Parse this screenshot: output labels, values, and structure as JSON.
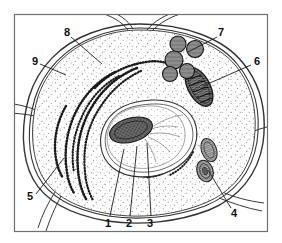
{
  "figure": {
    "kind": "biology-diagram",
    "frame": {
      "border_color": "#6f6f6f"
    },
    "colors": {
      "ink": "#1a1a1a",
      "paper": "#ffffff",
      "stipple": "#8c8c8c",
      "organelle_fill": "#9a9a9a",
      "organelle_dark": "#3a3a3a"
    },
    "labels": [
      {
        "id": "1",
        "text": "1",
        "x": 108,
        "y": 224,
        "leader_to_x": 124,
        "leader_to_y": 149
      },
      {
        "id": "2",
        "text": "2",
        "x": 129,
        "y": 224,
        "leader_to_x": 137,
        "leader_to_y": 146
      },
      {
        "id": "3",
        "text": "3",
        "x": 150,
        "y": 224,
        "leader_to_x": 147,
        "leader_to_y": 143
      },
      {
        "id": "4",
        "text": "4",
        "x": 234,
        "y": 214,
        "leader_to_x": 208,
        "leader_to_y": 170
      },
      {
        "id": "5",
        "text": "5",
        "x": 30,
        "y": 197,
        "leader_to_x": 64,
        "leader_to_y": 158
      },
      {
        "id": "6",
        "text": "6",
        "x": 257,
        "y": 62,
        "leader_to_x": 203,
        "leader_to_y": 86
      },
      {
        "id": "7",
        "text": "7",
        "x": 221,
        "y": 33,
        "leader_to_x": 188,
        "leader_to_y": 52
      },
      {
        "id": "8",
        "text": "8",
        "x": 67,
        "y": 33,
        "leader_to_x": 102,
        "leader_to_y": 64
      },
      {
        "id": "9",
        "text": "9",
        "x": 35,
        "y": 62,
        "leader_to_x": 66,
        "leader_to_y": 75
      }
    ],
    "structures": [
      {
        "name": "cell-wall",
        "label_ref": "9"
      },
      {
        "name": "cytoplasm",
        "label_ref": "8"
      },
      {
        "name": "rough-endoplasmic-reticulum",
        "label_ref": "5"
      },
      {
        "name": "nuclear-envelope",
        "label_ref": "1"
      },
      {
        "name": "nucleolus",
        "label_ref": "2"
      },
      {
        "name": "nucleoplasm",
        "label_ref": "3"
      },
      {
        "name": "plastid",
        "label_ref": "4"
      },
      {
        "name": "mitochondrion",
        "label_ref": "6"
      },
      {
        "name": "microbodies",
        "label_ref": "7"
      }
    ]
  }
}
